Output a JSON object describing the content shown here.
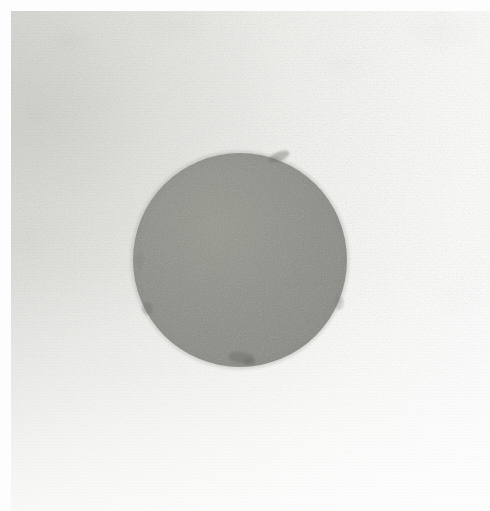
{
  "image": {
    "kind": "natural-image",
    "subject": "gray circular disc on textured paper",
    "description": "Scanned photograph of a uniform medium-gray circular disc resting on off-white textured paper",
    "width": 490,
    "height": 511,
    "caption": "",
    "visible_text": ""
  },
  "canvas": {
    "width_px": 490,
    "height_px": 511,
    "background_color": "#f2f2ef"
  },
  "margin": {
    "top_strip_px": 11,
    "left_strip_px": 11,
    "color": "#fdfdfd"
  },
  "background": {
    "name": "paper-substrate",
    "tone_upper_left": "#d8d8d4",
    "tone_mid": "#ececE8",
    "tone_lower_right": "#ffffff",
    "texture": "fine-grain-noise",
    "gradient_direction_deg": 102
  },
  "disc": {
    "name": "gray-disc",
    "shape": "circle",
    "center_x_px": 240,
    "center_y_px": 260,
    "radius_px": 107,
    "diameter_px": 214,
    "fill_color": "#8c8c87",
    "fill_color_light": "#96968f",
    "fill_color_dark": "#80807a",
    "edge": "soft-antialiased",
    "edge_blur_px": 2,
    "texture": "fine-grain-noise"
  },
  "artifacts": {
    "name": "edge-specks",
    "items": [
      {
        "label": "notch-top-right",
        "x_px": 268,
        "y_px": 152
      },
      {
        "label": "speck-bottom-a",
        "x_px": 228,
        "y_px": 352
      },
      {
        "label": "speck-bottom-b",
        "x_px": 243,
        "y_px": 358
      },
      {
        "label": "speck-left-lower",
        "x_px": 142,
        "y_px": 302
      },
      {
        "label": "speck-right-mid",
        "x_px": 334,
        "y_px": 296
      },
      {
        "label": "speck-left-mid",
        "x_px": 136,
        "y_px": 252
      }
    ]
  }
}
